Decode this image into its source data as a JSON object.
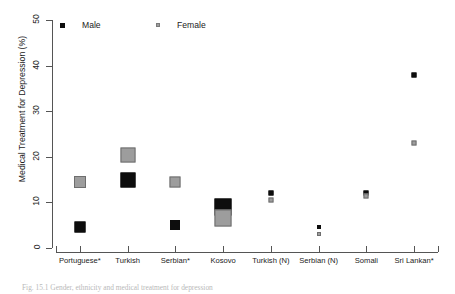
{
  "chart_data": {
    "type": "scatter",
    "title": "",
    "xlabel": "",
    "ylabel": "Medical Treatment for Depression (%)",
    "ylim": [
      0,
      50
    ],
    "ytick_labels": [
      "0",
      "10",
      "20",
      "30",
      "40",
      "50"
    ],
    "ytick_values": [
      0,
      10,
      20,
      30,
      40,
      50
    ],
    "grid": false,
    "legend_position": "top-left-inside",
    "categories": [
      "Portuguese*",
      "Turkish",
      "Serbian*",
      "Kosovo",
      "Turkish (N)",
      "Serbian (N)",
      "Somali",
      "Sri Lankan*"
    ],
    "series": [
      {
        "name": "Male",
        "color": "#0d0d0d",
        "marker": "square",
        "values": [
          4.5,
          15.0,
          5.0,
          9.0,
          12.0,
          4.5,
          12.0,
          38.0
        ],
        "marker_sizes": [
          11,
          15,
          10,
          17,
          5,
          4,
          5,
          5
        ]
      },
      {
        "name": "Female",
        "color": "#9d9d9d",
        "marker": "square",
        "values": [
          14.5,
          20.5,
          14.5,
          6.5,
          10.5,
          3.0,
          11.5,
          23.0
        ],
        "marker_sizes": [
          12,
          15,
          11,
          17,
          5,
          4,
          5,
          5
        ]
      }
    ]
  },
  "legend": {
    "entries": [
      {
        "label": "Male",
        "swatch": "black-square-icon"
      },
      {
        "label": "Female",
        "swatch": "gray-square-icon"
      }
    ]
  },
  "axes": {
    "y_title": "Medical Treatment for Depression (%)"
  },
  "caption": {
    "text": "Fig. 15.1  Gender, ethnicity and medical treatment for depression"
  }
}
